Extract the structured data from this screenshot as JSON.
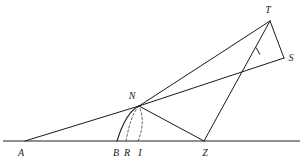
{
  "figure": {
    "type": "geometry-diagram",
    "canvas": {
      "width": 305,
      "height": 165
    },
    "colors": {
      "stroke": "#1a1a1a",
      "baseline": "#6b6b6b",
      "dashed": "#4a4a4a",
      "background": "#ffffff",
      "label": "#1a1a1a"
    },
    "points": [
      {
        "id": "A",
        "label": "A",
        "x": 25,
        "y": 141,
        "label_x": 21,
        "label_y": 153
      },
      {
        "id": "B",
        "label": "B",
        "x": 117,
        "y": 141,
        "label_x": 116,
        "label_y": 153
      },
      {
        "id": "R",
        "label": "R",
        "x": 126,
        "y": 141,
        "label_x": 127,
        "label_y": 153
      },
      {
        "id": "I",
        "label": "I",
        "x": 138,
        "y": 141,
        "label_x": 140,
        "label_y": 153
      },
      {
        "id": "Z",
        "label": "Z",
        "x": 204,
        "y": 141,
        "label_x": 205,
        "label_y": 153
      },
      {
        "id": "N",
        "label": "N",
        "x": 139,
        "y": 106,
        "label_x": 132,
        "label_y": 96
      },
      {
        "id": "T",
        "label": "T",
        "x": 270,
        "y": 21,
        "label_x": 268,
        "label_y": 10
      },
      {
        "id": "S",
        "label": "S",
        "x": 284,
        "y": 58,
        "label_x": 291,
        "label_y": 58
      }
    ],
    "baseline": {
      "name": "horizontal-axis",
      "x1": 3,
      "y1": 141,
      "x2": 300,
      "y2": 141
    },
    "segments": [
      {
        "name": "segment-A-N",
        "from": "A",
        "to": "N",
        "style": "solid"
      },
      {
        "name": "segment-N-T",
        "from": "N",
        "to": "T",
        "style": "solid"
      },
      {
        "name": "segment-N-S",
        "from": "N",
        "to": "S",
        "style": "solid"
      },
      {
        "name": "segment-N-Z",
        "from": "N",
        "to": "Z",
        "style": "solid"
      },
      {
        "name": "segment-Z-T",
        "from": "Z",
        "to": "T",
        "style": "solid"
      },
      {
        "name": "segment-T-S",
        "from": "T",
        "to": "S",
        "style": "solid"
      }
    ],
    "arcs": [
      {
        "name": "arc-B-N",
        "from": "B",
        "to": "N",
        "style": "solid",
        "control_x": 126,
        "control_y": 112
      },
      {
        "name": "arc-R-N",
        "from": "R",
        "to": "N",
        "style": "dashed",
        "control_x": 131,
        "control_y": 114
      },
      {
        "name": "arc-I-N",
        "from": "I",
        "to": "N",
        "style": "dashed",
        "control_x": 146,
        "control_y": 122
      }
    ],
    "tick_marks": [
      {
        "name": "tick-on-segment-N-S",
        "x": 258,
        "y": 51,
        "angle_deg": 62,
        "length": 7
      }
    ]
  }
}
